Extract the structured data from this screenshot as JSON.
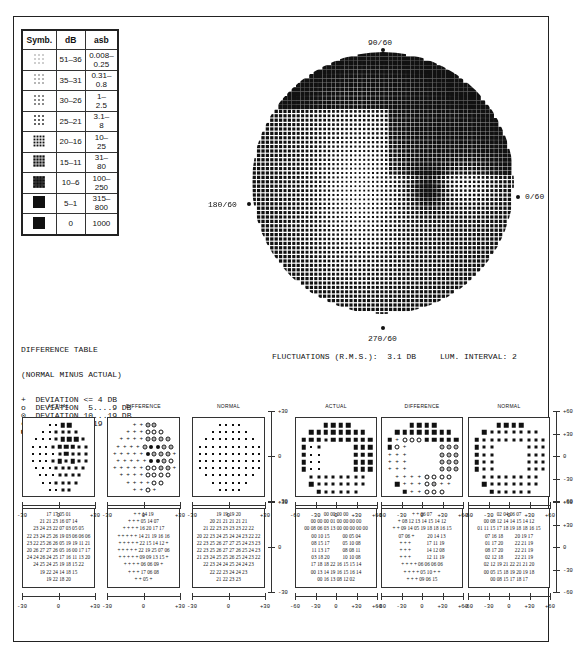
{
  "legend_table": {
    "headers": [
      "Symb.",
      "dB",
      "asb"
    ],
    "rows": [
      {
        "symbol": "density-1",
        "db": "51–36",
        "asb": "0.008–\n0.25"
      },
      {
        "symbol": "density-2",
        "db": "35–31",
        "asb": "0.31–\n0.8"
      },
      {
        "symbol": "density-3",
        "db": "30–26",
        "asb": "1–\n2.5"
      },
      {
        "symbol": "density-4",
        "db": "25–21",
        "asb": "3.1–\n8"
      },
      {
        "symbol": "density-5",
        "db": "20–16",
        "asb": "10–\n25"
      },
      {
        "symbol": "density-6",
        "db": "15–11",
        "asb": "31–\n80"
      },
      {
        "symbol": "density-7",
        "db": "10–6",
        "asb": "100–\n250"
      },
      {
        "symbol": "density-8",
        "db": "5–1",
        "asb": "315–\n800"
      },
      {
        "symbol": "density-9",
        "db": "0",
        "asb": "1000"
      }
    ]
  },
  "field_plot": {
    "label_top": "90/60",
    "label_right": "0/60",
    "label_left": "180/60",
    "label_bottom": "270/60"
  },
  "difference_legend": {
    "title": "DIFFERENCE TABLE",
    "subtitle": "(NORMAL MINUS ACTUAL)",
    "items": [
      {
        "symbol": "+",
        "text": "DEVIATION <= 4 DB"
      },
      {
        "symbol": "o",
        "text": "DEVIATION  5....9 DB"
      },
      {
        "symbol": "⊙",
        "text": "DEVIATION 10...19 DB"
      },
      {
        "symbol": "●",
        "text": "DEVIATION > 19 DB"
      },
      {
        "symbol": "■",
        "text": "ABS. DEFECT"
      }
    ]
  },
  "stats": {
    "fluctuations": "FLUCTUATIONS (R.M.S.):  3.1 DB",
    "lum_interval": "LUM. INTERVAL: 2"
  },
  "panels": {
    "titles": [
      "ACTUAL",
      "DIFFERENCE",
      "NORMAL",
      "ACTUAL",
      "DIFFERENCE",
      "NORMAL"
    ],
    "central_x_ticks": [
      "-30",
      "0",
      "+30"
    ],
    "central_y_ticks": [
      "+30",
      "0",
      "-30"
    ],
    "peripheral_x_ticks": [
      "-60",
      "-30",
      "0",
      "+30",
      "+60"
    ],
    "peripheral_y_ticks": [
      "+60",
      "+30",
      "0",
      "-30",
      "-60"
    ]
  },
  "numeric_grids": {
    "central_actual": [
      "17 17 05 01",
      "21 21 23 16 07 14",
      "23 24 23 22 07 03 05 05",
      "22 23 24 25 26 19 03 06 06 06",
      "23 22 25 26 26 05 19 19 11 21",
      "20 26 27 27 26 05 16 00 17 17",
      "24 24 26 24 25 17 16 11 13 20",
      "24 25 24 25 19 18 15 22",
      "19 22 24 14 18 15",
      "19 22 18 20"
    ],
    "central_difference": [
      "+ + 14 19",
      "+ + + 05 14 07",
      "+ + + + 16 20 17 17",
      "+ + + + + 14 21 19 16 16",
      "+ + + + + 22 15 14 12 +",
      "+ + + + + 22 19 25 07 06",
      "+ + + + + 09 09 13 15 +",
      "+ + + + 06 06 09 +",
      "+ + + 17 06 08",
      "+ + 05 +"
    ],
    "central_normal": [
      "19 19 19 20",
      "20 21 21 21 21 21",
      "21 22 23 23 23 23 22 22",
      "20 22 23 24 25 24 24 23 22 22",
      "22 23 25 26 27 27 25 24 23 23",
      "22 23 25 26 27 27 26 25 24 23",
      "21 23 24 25 25 26 25 24 23 22",
      "22 23 24 24 25 24 24 23",
      "22 22 23 24 24 23",
      "21 22 23 23"
    ],
    "peripheral_actual": [
      "00 00 00 00",
      "00 00 00 01 00 00 00 00",
      "00 08 06 03 13 00 00 00 00 00",
      "00 10 15          00 05 04",
      "08 15 17          05 10 08",
      "11 13 17          08 08 11",
      "03 18 20          10 10 08",
      "17 18 18 22 16 15 15 14",
      "00 13 14 19 16 15 16 14",
      "00 16 13 08 12 02"
    ],
    "peripheral_difference": [
      "+ + 06 07",
      "+ 08 12 13 14 15 14 12",
      "+ + 09 14 05 19 18 18 16 15",
      "07 06 +          20 14 13",
      "+ + +            17 11 19",
      "+ + +            14 12 08",
      "+ + +            12 11 19",
      "+ + + + 06 06 06 06",
      "+ + + + 05 10 + +",
      "+ + + 09 06 15"
    ],
    "peripheral_normal": [
      "02 04 06 07",
      "00 08 12 14 14 15 14 12",
      "01 11 15 17 18 19 18 18 16 15",
      "07 16 18         20 19 17",
      "01 17 20         22 21 19",
      "08 17 20         22 21 19",
      "02 12 18         22 21 19",
      "02 12 19 21 22 21 21 20",
      "00 05 15 18 19 20 19 18",
      "00 08 15 17 18 17"
    ]
  }
}
